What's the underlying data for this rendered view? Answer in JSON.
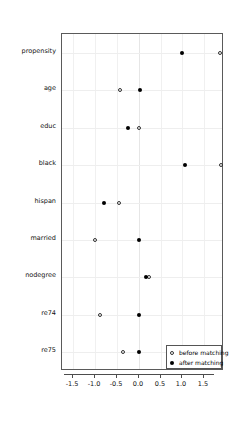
{
  "chart_data": {
    "type": "scatter",
    "title": "",
    "xlabel": "",
    "ylabel": "",
    "xlim": [
      -1.75,
      1.95
    ],
    "ylim_categories_top_to_bottom": true,
    "grid": true,
    "legend_position": "bottom-right",
    "categories": [
      "propensity",
      "age",
      "educ",
      "black",
      "hispan",
      "married",
      "nodegree",
      "re74",
      "re75"
    ],
    "xticks": [
      -1.5,
      -1.0,
      -0.5,
      0.0,
      0.5,
      1.0,
      1.5
    ],
    "xticklabels": [
      "-1.5",
      "-1.0",
      "-0.5",
      "0.0",
      "0.5",
      "1.0",
      "1.5"
    ],
    "series": [
      {
        "name": "before matching",
        "marker": "open-circle",
        "color": "#333333",
        "values": [
          1.87,
          -0.43,
          0.01,
          1.89,
          -0.45,
          -0.99,
          0.24,
          -0.88,
          -0.35
        ]
      },
      {
        "name": "after matching",
        "marker": "filled-circle",
        "color": "#000000",
        "values": [
          0.99,
          0.03,
          -0.24,
          1.07,
          -0.8,
          0.0,
          0.16,
          0.0,
          0.0
        ]
      }
    ]
  },
  "legend": {
    "items": [
      {
        "label": "before matching",
        "marker": "open-circle"
      },
      {
        "label": "after matching",
        "marker": "filled-circle"
      }
    ]
  }
}
